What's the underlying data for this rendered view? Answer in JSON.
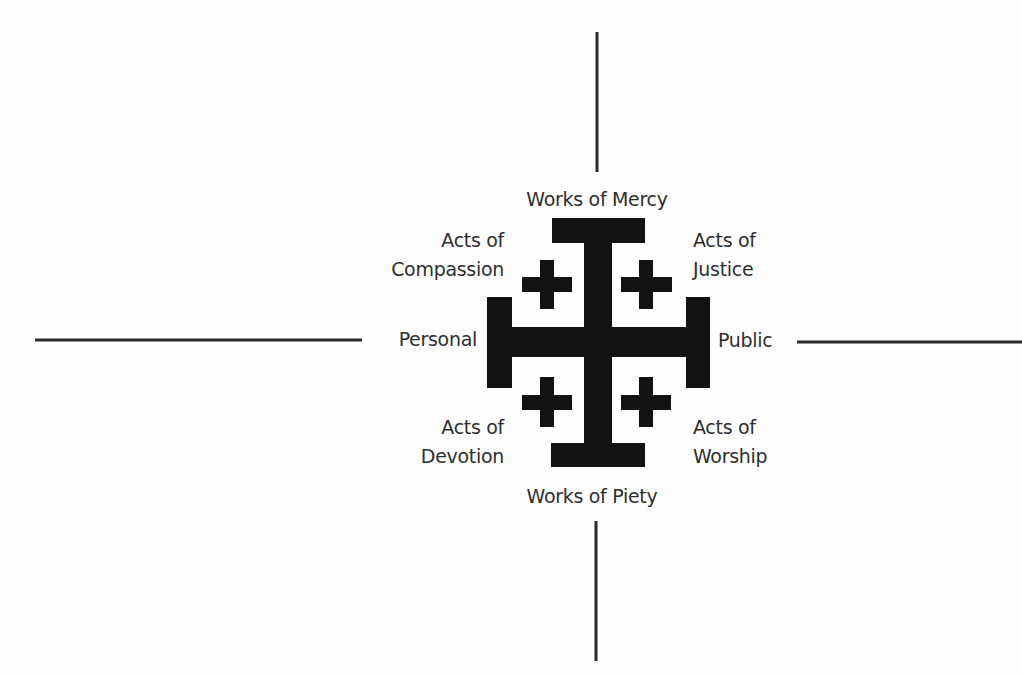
{
  "diagram": {
    "type": "Jerusalem cross quadrant diagram",
    "colors": {
      "shape": "#121212",
      "text": "#2f2f2f",
      "background": "#fefefe"
    },
    "axes": {
      "top": "Works of Mercy",
      "bottom": "Works of Piety",
      "left": "Personal",
      "right": "Public"
    },
    "quadrants": {
      "top_left": {
        "line1": "Acts of",
        "line2": "Compassion"
      },
      "top_right": {
        "line1": "Acts of",
        "line2": "Justice"
      },
      "bottom_left": {
        "line1": "Acts of",
        "line2": "Devotion"
      },
      "bottom_right": {
        "line1": "Acts of",
        "line2": "Worship"
      }
    },
    "central_symbol": "jerusalem-cross"
  }
}
